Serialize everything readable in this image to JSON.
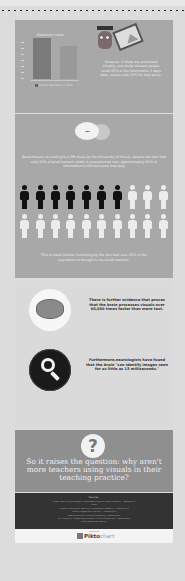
{
  "header": {
    "top_text": "",
    "divider": "dotted"
  },
  "section_chart": {
    "chart_title": "Retention rates",
    "legend": "Visual learners vs Text",
    "description": "However, if ideas are presented visually, one study showed people recall 65% of the information 3 days later, versus only 10% for text alone."
  },
  "section_bubbles": {
    "bubble_text": "...",
    "description": "Nevertheless, according to a 3M study by the University of Illinois, despite the fact that only 10% of what learners retain is presented as text, approximately 80% of information is still delivered that way."
  },
  "section_people": {
    "dark_count": 7,
    "total_row1": 10,
    "total_row2": 10,
    "description": "This is made further frustrating by the fact that over 65% of the population is thought to be visual learners."
  },
  "section_facts": {
    "brain_text": "There is further evidence that proves that the brain processes visuals over 60,000 times faster than mere text.",
    "search_text": "Furthermore,neurologists have found that the brain \"can identify images seen for as little as 13 milliseconds.\""
  },
  "section_question": {
    "icon": "?",
    "text": "So it raises the question: why aren't more teachers using visuals in their teaching practice?"
  },
  "sources": {
    "title": "Sources:",
    "lines": [
      "Visual Teaching Strategies, Visual Learning and Visual Literacy - reference 1",
      "More",
      "Visual thinking and learning in education research - reference 2",
      "Visual images and memory - reference 3",
      "Neuroscience of visual processing - reference 4",
      "MIT study on image identification in 13 milliseconds - reference 5",
      "www.reference-site.org"
    ]
  },
  "footer": {
    "made_with": "made with",
    "brand_main": "Piktochart",
    "brand_bold": "Pikto",
    "brand_light": "chart"
  }
}
